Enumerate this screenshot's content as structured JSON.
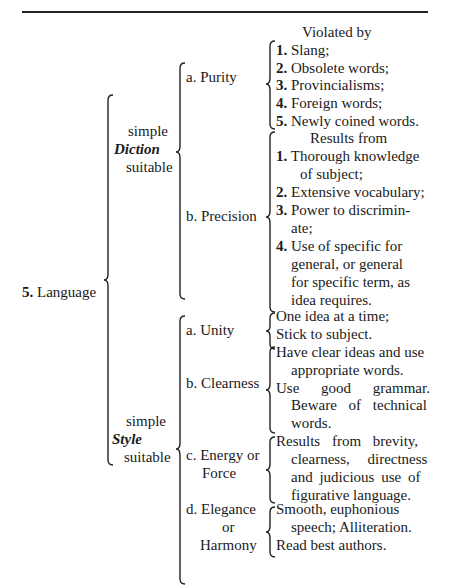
{
  "page": {
    "topic": {
      "number": "5.",
      "label": "Language"
    },
    "diction": {
      "label_lines": [
        "simple",
        "Diction",
        "suitable"
      ],
      "items": [
        {
          "label": "a. Purity",
          "header": "Violated by",
          "entries": [
            {
              "num": "1.",
              "text": "Slang;"
            },
            {
              "num": "2.",
              "text": "Obsolete words;"
            },
            {
              "num": "3.",
              "text": "Provincialisms;"
            },
            {
              "num": "4.",
              "text": "Foreign words;"
            },
            {
              "num": "5.",
              "text": "Newly coined words."
            }
          ]
        },
        {
          "label": "b. Precision",
          "header": "Results from",
          "entries": [
            {
              "num": "1.",
              "lines": [
                "Thorough knowledge",
                "of subject;"
              ]
            },
            {
              "num": "2.",
              "lines": [
                "Extensive vocabulary;"
              ]
            },
            {
              "num": "3.",
              "lines": [
                "Power to discrimin-",
                "ate;"
              ]
            },
            {
              "num": "4.",
              "lines": [
                "Use of specific for",
                "general, or general",
                "for specific term, as",
                "idea requires."
              ]
            }
          ]
        }
      ]
    },
    "style": {
      "label_lines": [
        "simple",
        "Style",
        "suitable"
      ],
      "items": [
        {
          "label_lines": [
            "a. Unity"
          ],
          "lines": [
            "One idea at a time;",
            "Stick to subject."
          ]
        },
        {
          "label_lines": [
            "b. Clearness"
          ],
          "lines": [
            "Have clear ideas and use",
            "appropriate words.",
            "Use good grammar.",
            "Beware of technical",
            "words."
          ]
        },
        {
          "label_lines": [
            "c. Energy or",
            "Force"
          ],
          "lines": [
            "Results from brevity,",
            "clearness, directness",
            "and judicious use of",
            "figurative language."
          ]
        },
        {
          "label_lines": [
            "d. Elegance",
            "or",
            "Harmony"
          ],
          "lines": [
            "Smooth, euphonious",
            "speech; Alliteration.",
            "Read best authors."
          ]
        }
      ]
    }
  }
}
